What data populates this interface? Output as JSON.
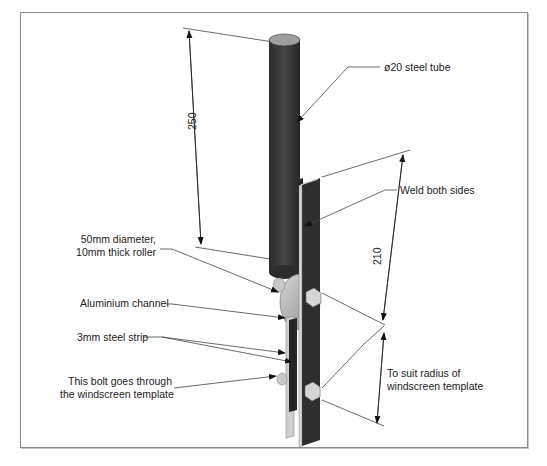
{
  "diagram": {
    "type": "technical-assembly-drawing",
    "labels": {
      "tube": "ø20 steel tube",
      "weld": "Weld both sides",
      "roller_line1": "50mm diameter,",
      "roller_line2": "10mm thick roller",
      "channel": "Aluminium channel",
      "strip": "3mm steel strip",
      "bolt_line1": "This bolt goes through",
      "bolt_line2": "the windscreen template",
      "radius_line1": "To suit radius of",
      "radius_line2": "windscreen template"
    },
    "dimensions": {
      "tube_length": "250",
      "strip_length": "210"
    },
    "colors": {
      "tube": "#3a3a3a",
      "tube_top": "#9a9a9a",
      "strip": "#2e2e2e",
      "strip_edge": "#d8d8d8",
      "roller": "#b8b8b8",
      "bolt": "#d0d0d0",
      "line": "#333333",
      "frame": "#8a8a8a"
    }
  }
}
